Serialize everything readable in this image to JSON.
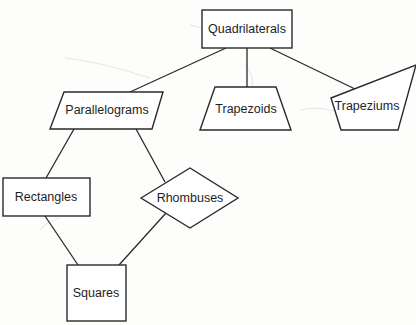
{
  "diagram": {
    "nodes": {
      "quadrilaterals": {
        "label": "Quadrilaterals",
        "shape": "rectangle"
      },
      "parallelograms": {
        "label": "Parallelograms",
        "shape": "parallelogram"
      },
      "trapezoids": {
        "label": "Trapezoids",
        "shape": "trapezoid"
      },
      "trapeziums": {
        "label": "Trapeziums",
        "shape": "trapezium"
      },
      "rectangles": {
        "label": "Rectangles",
        "shape": "rectangle"
      },
      "rhombuses": {
        "label": "Rhombuses",
        "shape": "rhombus"
      },
      "squares": {
        "label": "Squares",
        "shape": "square"
      }
    },
    "edges": [
      {
        "from": "Quadrilaterals",
        "to": "Parallelograms"
      },
      {
        "from": "Quadrilaterals",
        "to": "Trapezoids"
      },
      {
        "from": "Quadrilaterals",
        "to": "Trapeziums"
      },
      {
        "from": "Parallelograms",
        "to": "Rectangles"
      },
      {
        "from": "Parallelograms",
        "to": "Rhombuses"
      },
      {
        "from": "Rectangles",
        "to": "Squares"
      },
      {
        "from": "Rhombuses",
        "to": "Squares"
      }
    ],
    "colors": {
      "stroke": "#2a2a2a",
      "fill": "#ffffff",
      "text": "#1e1e1e"
    }
  }
}
